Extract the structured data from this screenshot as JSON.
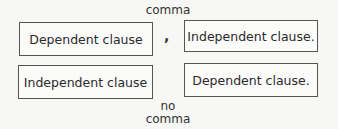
{
  "diagram": {
    "top_label": "comma",
    "row1": {
      "left_box": "Dependent clause",
      "separator": ",",
      "right_box": "Independent clause."
    },
    "row2": {
      "left_box": "Independent clause",
      "right_box": "Dependent clause."
    },
    "bottom_label_line1": "no",
    "bottom_label_line2": "comma"
  }
}
